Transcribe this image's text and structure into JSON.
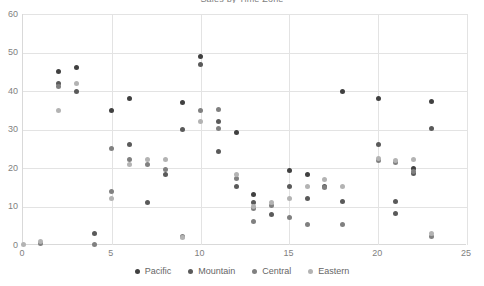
{
  "chart_data": {
    "type": "scatter",
    "title": "Sales by Time Zone",
    "xlabel": "",
    "ylabel": "",
    "xlim": [
      0,
      25
    ],
    "ylim": [
      0,
      60
    ],
    "xticks": [
      0,
      5,
      10,
      15,
      20,
      25
    ],
    "yticks": [
      0,
      10,
      20,
      30,
      40,
      50,
      60
    ],
    "grid": true,
    "legend_position": "bottom",
    "series": [
      {
        "name": "Pacific",
        "color": "#404040",
        "points": [
          [
            2,
            45
          ],
          [
            3,
            46
          ],
          [
            5,
            35
          ],
          [
            6,
            38
          ],
          [
            9,
            37
          ],
          [
            10,
            49
          ],
          [
            12,
            29.3
          ],
          [
            13,
            13.2
          ],
          [
            15,
            19.3
          ],
          [
            16,
            18.4
          ],
          [
            18,
            40
          ],
          [
            20,
            38
          ],
          [
            22,
            19.8
          ],
          [
            23,
            37.2
          ]
        ]
      },
      {
        "name": "Mountain",
        "color": "#5a5a5a",
        "points": [
          [
            2,
            42
          ],
          [
            3,
            40
          ],
          [
            4,
            3
          ],
          [
            6,
            26
          ],
          [
            7,
            11
          ],
          [
            8,
            18.3
          ],
          [
            9,
            30
          ],
          [
            10,
            47
          ],
          [
            11,
            32
          ],
          [
            11,
            24.3
          ],
          [
            12,
            15.2
          ],
          [
            13,
            11
          ],
          [
            14,
            8
          ],
          [
            15,
            15.2
          ],
          [
            16,
            12
          ],
          [
            17,
            15.3
          ],
          [
            18,
            11.2
          ],
          [
            20,
            26.2
          ],
          [
            21,
            11.2
          ],
          [
            21,
            8.2
          ],
          [
            22,
            18.5
          ],
          [
            23,
            30.3
          ]
        ]
      },
      {
        "name": "Central",
        "color": "#808080",
        "points": [
          [
            1,
            0.4
          ],
          [
            2,
            41.2
          ],
          [
            4,
            0.2
          ],
          [
            5,
            25
          ],
          [
            5,
            14
          ],
          [
            6,
            22.2
          ],
          [
            7,
            21
          ],
          [
            8,
            19.5
          ],
          [
            9,
            2.3
          ],
          [
            10,
            35
          ],
          [
            11,
            35.3
          ],
          [
            11,
            30.2
          ],
          [
            12,
            17.3
          ],
          [
            13,
            9.5
          ],
          [
            13,
            6.2
          ],
          [
            14,
            10.3
          ],
          [
            15,
            7.2
          ],
          [
            16,
            5.3
          ],
          [
            17,
            15
          ],
          [
            18,
            5.3
          ],
          [
            20,
            22
          ],
          [
            21,
            21.3
          ],
          [
            22,
            19.2
          ],
          [
            23,
            2.2
          ]
        ]
      },
      {
        "name": "Eastern",
        "color": "#b3b3b3",
        "points": [
          [
            0,
            0.2
          ],
          [
            1,
            1
          ],
          [
            2,
            35
          ],
          [
            3,
            42
          ],
          [
            5,
            12
          ],
          [
            6,
            21
          ],
          [
            7,
            22.3
          ],
          [
            8,
            22.2
          ],
          [
            9,
            2
          ],
          [
            10,
            32
          ],
          [
            12,
            18.3
          ],
          [
            13,
            10
          ],
          [
            14,
            11
          ],
          [
            15,
            12
          ],
          [
            16,
            15.2
          ],
          [
            17,
            17
          ],
          [
            18,
            15.2
          ],
          [
            20,
            22.4
          ],
          [
            21,
            22
          ],
          [
            22,
            22.2
          ],
          [
            23,
            3
          ]
        ]
      }
    ]
  },
  "axis": {
    "y_labels": [
      "60",
      "50",
      "40",
      "30",
      "20",
      "10",
      "0"
    ],
    "x_labels": [
      "0",
      "5",
      "10",
      "15",
      "20",
      "25"
    ]
  },
  "legend": {
    "items": [
      {
        "label": "Pacific",
        "color": "#404040"
      },
      {
        "label": "Mountain",
        "color": "#5a5a5a"
      },
      {
        "label": "Central",
        "color": "#808080"
      },
      {
        "label": "Eastern",
        "color": "#b3b3b3"
      }
    ]
  }
}
